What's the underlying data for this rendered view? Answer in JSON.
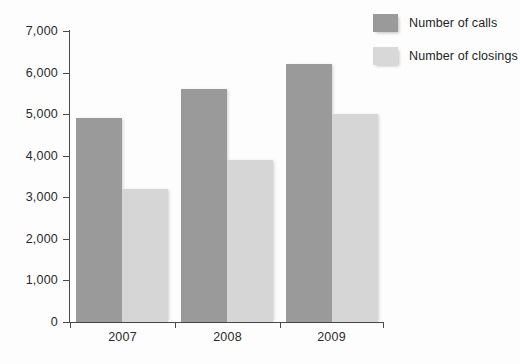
{
  "chart_data": {
    "type": "bar",
    "title": "",
    "subtitle": "",
    "xlabel": "",
    "ylabel": "",
    "categories": [
      "2007",
      "2008",
      "2009"
    ],
    "series": [
      {
        "name": "Number of calls",
        "values": [
          4900,
          5600,
          6200
        ],
        "color": "#9a9a9a"
      },
      {
        "name": "Number of closings",
        "values": [
          3200,
          3900,
          5000
        ],
        "color": "#d6d6d6"
      }
    ],
    "ylim": [
      0,
      7000
    ],
    "ytick_values": [
      0,
      1000,
      2000,
      3000,
      4000,
      5000,
      6000,
      7000
    ],
    "ytick_labels": [
      "0",
      "1,000",
      "2,000",
      "3,000",
      "4,000",
      "5,000",
      "6,000",
      "7,000"
    ],
    "grid": false,
    "legend_position": "top-right",
    "bar_grouping": "grouped-adjacent"
  },
  "legend": {
    "items": [
      {
        "label": "Number of calls",
        "swatch": "calls"
      },
      {
        "label": "Number of closings",
        "swatch": "closings"
      }
    ]
  },
  "axes": {
    "y": {
      "labels": [
        "7,000",
        "6,000",
        "5,000",
        "4,000",
        "3,000",
        "2,000",
        "1,000",
        "0"
      ]
    },
    "x": {
      "labels": [
        "2007",
        "2008",
        "2009"
      ]
    }
  }
}
